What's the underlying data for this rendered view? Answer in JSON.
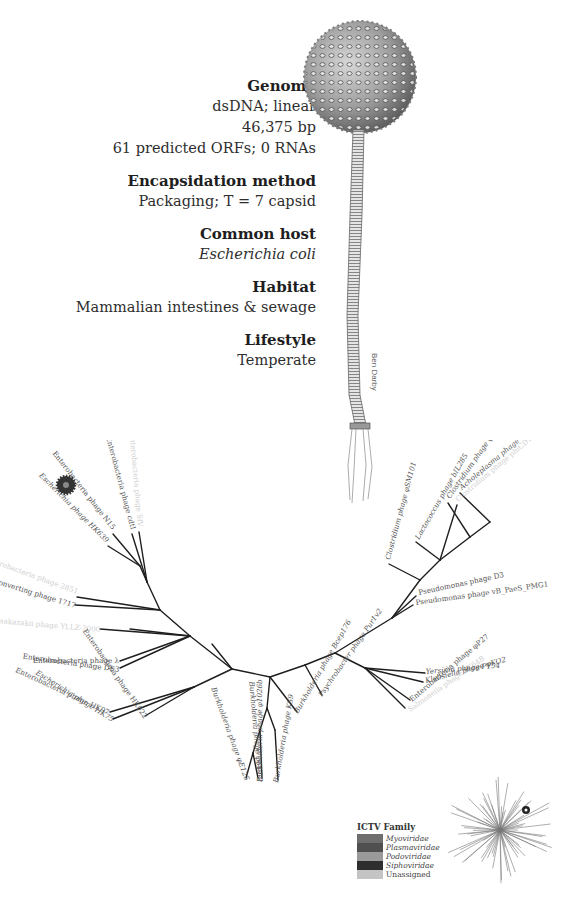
{
  "info": {
    "genome": {
      "heading": "Genome",
      "lines": [
        "dsDNA; linear",
        "46,375 bp",
        "61 predicted ORFs; 0 RNAs"
      ]
    },
    "encapsidation": {
      "heading": "Encapsidation method",
      "value": "Packaging; T = 7 capsid"
    },
    "host": {
      "heading": "Common host",
      "value": "Escherichia coli"
    },
    "habitat": {
      "heading": "Habitat",
      "value": "Mammalian intestines & sewage"
    },
    "lifestyle": {
      "heading": "Lifestyle",
      "value": "Temperate"
    }
  },
  "illustration": {
    "signature": "Ben Darby",
    "subject": "phage-virion-drawing"
  },
  "tree": {
    "labels": [
      "Enterobacteria phage N15",
      "Escherichia phage HK639",
      "Enterobacteria phage cdtI",
      "Enterobacteria phage SfV",
      "Enterobacteria phage 2851",
      "Stx2 converting phage 1717",
      "Cronobacter sakazakii phage YLLZ-2000",
      "Enterobacteria phage λ",
      "Enterobacteria phage DE3",
      "Enterobacteria phage HK97",
      "Escherichia phage HK75",
      "Enterobacteria phage HK022",
      "Burkholderia phage φE125",
      "Burkholderia phage φ644-2",
      "Burkholderia phage φ1026b",
      "Burkholderia phage KS9",
      "Burkholderia phage Bcep176",
      "Psychrobacter phage Pur1v2",
      "Enterobacteria phage φP27",
      "Salmonella phage ST64B",
      "Klebsiella phage φKO2",
      "Yersinia phage PY54",
      "Pseudomonas phage vB_PaeS_PMG1",
      "Pseudomonas phage D3",
      "Acholeplasma phage L2",
      "Clostridium phage φ3626",
      "Clostridium phage phiCD119",
      "Lactococcus phage bIL285",
      "Clostridium phage φSM101"
    ]
  },
  "legend": {
    "title": "ICTV Family",
    "items": [
      {
        "name": "Myoviridae",
        "color": "#6e6e6e"
      },
      {
        "name": "Plasmaviridae",
        "color": "#505050"
      },
      {
        "name": "Podoviridae",
        "color": "#9a9a9a"
      },
      {
        "name": "Siphoviridae",
        "color": "#2e2e2e"
      },
      {
        "name": "Unassigned",
        "color": "#c4c4c4"
      }
    ]
  }
}
